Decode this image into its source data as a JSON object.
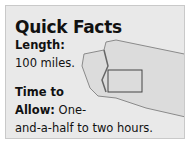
{
  "card": {
    "title": "Quick Facts",
    "length_label": "Length:",
    "length_value": "100 miles.",
    "time_label_line1": "Time to",
    "time_label_line2": "Allow:",
    "time_value_line1": " One-",
    "time_value_line2": "and-a-half to two hours."
  },
  "map": {
    "depicts": "washington-state-outline",
    "highlight": "rectangle-region"
  },
  "colors": {
    "card_bg": "#e9e9e9",
    "border": "#c9c9c9",
    "text": "#111111"
  }
}
